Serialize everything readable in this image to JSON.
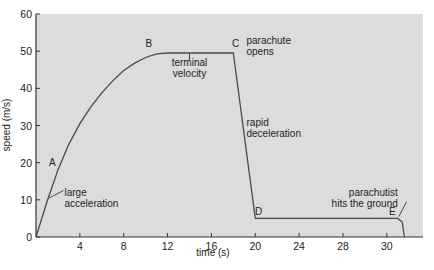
{
  "chart_data": {
    "type": "line",
    "title": "",
    "xlabel": "time (s)",
    "ylabel": "speed (m/s)",
    "xlim": [
      0,
      35.3
    ],
    "ylim": [
      0,
      60
    ],
    "grid": false,
    "x_ticks": [
      4,
      8,
      12,
      16,
      20,
      24,
      28,
      30
    ],
    "x_tick_positions": [
      4,
      8,
      12,
      16,
      20,
      24,
      28,
      32
    ],
    "y_ticks": [
      0,
      10,
      20,
      30,
      40,
      50,
      60
    ],
    "background": "#dcdcdc",
    "line_color": "#4a4a4a",
    "series": [
      {
        "name": "speed",
        "x": [
          0,
          1,
          2,
          3,
          4,
          5,
          6,
          7,
          8,
          9,
          10,
          11,
          12,
          18,
          20,
          33,
          33.4,
          33.6
        ],
        "values": [
          0,
          9.5,
          18,
          25,
          30.5,
          35,
          38.8,
          42,
          44.8,
          46.8,
          48.3,
          49.3,
          49.5,
          49.5,
          5,
          5,
          4,
          0
        ]
      }
    ],
    "points": [
      {
        "label": "A",
        "x": 1.5,
        "y": 19
      },
      {
        "label": "B",
        "x": 10.3,
        "y": 51
      },
      {
        "label": "C",
        "x": 18.2,
        "y": 51
      },
      {
        "label": "D",
        "x": 20.3,
        "y": 6
      },
      {
        "label": "E",
        "x": 32.5,
        "y": 6
      }
    ],
    "annotations": [
      {
        "text": [
          "large",
          "acceleration"
        ],
        "x": 2.6,
        "y": 11
      },
      {
        "text": [
          "terminal",
          "velocity"
        ],
        "x": 14,
        "y": 46
      },
      {
        "text": [
          "parachute",
          "opens"
        ],
        "x": 19.2,
        "y": 52
      },
      {
        "text": [
          "rapid",
          "deceleration"
        ],
        "x": 19.2,
        "y": 30
      },
      {
        "text": [
          "parachutist",
          "hits the ground"
        ],
        "x": 33,
        "y": 11
      }
    ]
  }
}
